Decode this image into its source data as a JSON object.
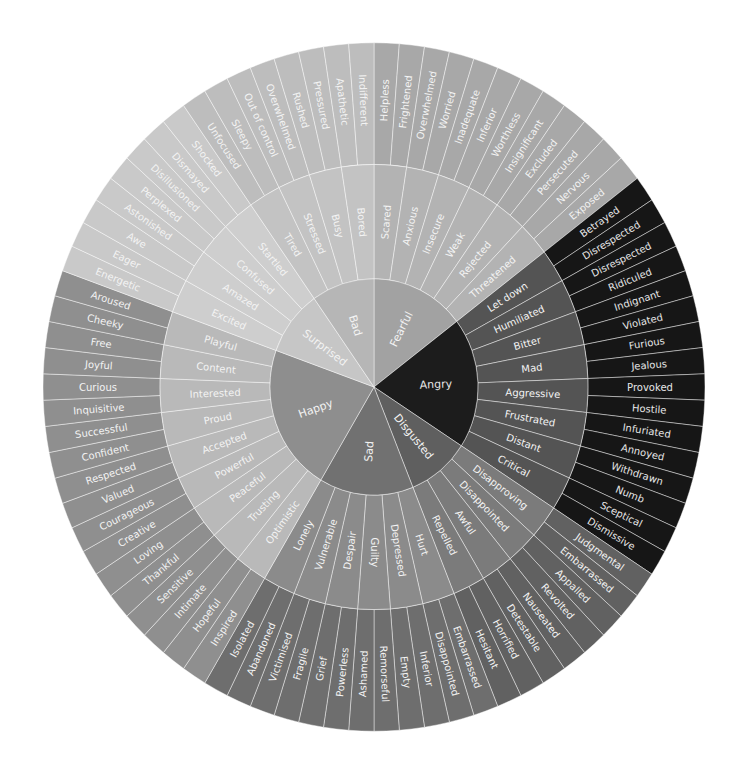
{
  "wheel": {
    "title": "",
    "geometry": {
      "center": [
        374,
        387
      ],
      "radii": [
        0,
        104,
        214,
        331
      ],
      "y_scale": 1.04
    },
    "label_color": "#f3f3f3",
    "divider_color": "#ffffff",
    "categories": [
      {
        "label": "Fearful",
        "colors": {
          "inner": "#a2a2a2",
          "middle": "#b3b3b3",
          "outer": "#a8a8a8"
        },
        "children": [
          {
            "label": "Scared",
            "children": [
              "Helpless",
              "Frightened"
            ]
          },
          {
            "label": "Anxious",
            "children": [
              "Overwhelmed",
              "Worried"
            ]
          },
          {
            "label": "Insecure",
            "children": [
              "Inadequate",
              "Inferior"
            ]
          },
          {
            "label": "Weak",
            "children": [
              "Worthless",
              "Insignificant"
            ]
          },
          {
            "label": "Rejected",
            "children": [
              "Excluded",
              "Persecuted"
            ]
          },
          {
            "label": "Threatened",
            "children": [
              "Nervous",
              "Exposed"
            ]
          }
        ]
      },
      {
        "label": "Angry",
        "colors": {
          "inner": "#1c1c1c",
          "middle": "#545454",
          "outer": "#161616"
        },
        "children": [
          {
            "label": "Let down",
            "children": [
              "Betrayed",
              "Disrespected"
            ]
          },
          {
            "label": "Humiliated",
            "children": [
              "Disrespected",
              "Ridiculed"
            ]
          },
          {
            "label": "Bitter",
            "children": [
              "Indignant",
              "Violated"
            ]
          },
          {
            "label": "Mad",
            "children": [
              "Furious",
              "Jealous"
            ]
          },
          {
            "label": "Aggressive",
            "children": [
              "Provoked",
              "Hostile"
            ]
          },
          {
            "label": "Frustrated",
            "children": [
              "Infuriated",
              "Annoyed"
            ]
          },
          {
            "label": "Distant",
            "children": [
              "Withdrawn",
              "Numb"
            ]
          },
          {
            "label": "Critical",
            "children": [
              "Sceptical",
              "Dismissive"
            ]
          }
        ]
      },
      {
        "label": "Disgusted",
        "colors": {
          "inner": "#5f5f5f",
          "middle": "#7b7b7b",
          "outer": "#616161"
        },
        "children": [
          {
            "label": "Disapproving",
            "children": [
              "Judgmental",
              "Embarrassed"
            ]
          },
          {
            "label": "Disappointed",
            "children": [
              "Appalled",
              "Revolted"
            ]
          },
          {
            "label": "Awful",
            "children": [
              "Nauseated",
              "Detestable"
            ]
          },
          {
            "label": "Repelled",
            "children": [
              "Horrified",
              "Hesitant"
            ]
          }
        ]
      },
      {
        "label": "Sad",
        "colors": {
          "inner": "#717171",
          "middle": "#8b8b8b",
          "outer": "#6e6e6e"
        },
        "children": [
          {
            "label": "Hurt",
            "children": [
              "Embarrassed",
              "Disappointed"
            ]
          },
          {
            "label": "Depressed",
            "children": [
              "Inferior",
              "Empty"
            ]
          },
          {
            "label": "Guilty",
            "children": [
              "Remorseful",
              "Ashamed"
            ]
          },
          {
            "label": "Despair",
            "children": [
              "Powerless",
              "Grief"
            ]
          },
          {
            "label": "Vulnerable",
            "children": [
              "Fragile",
              "Victimised"
            ]
          },
          {
            "label": "Lonely",
            "children": [
              "Abandoned",
              "Isolated"
            ]
          }
        ]
      },
      {
        "label": "Happy",
        "colors": {
          "inner": "#8e8e8e",
          "middle": "#b9b9b9",
          "outer": "#8f8f8f"
        },
        "children": [
          {
            "label": "Optimistic",
            "children": [
              "Inspired",
              "Hopeful"
            ]
          },
          {
            "label": "Trusting",
            "children": [
              "Intimate",
              "Sensitive"
            ]
          },
          {
            "label": "Peaceful",
            "children": [
              "Thankful",
              "Loving"
            ]
          },
          {
            "label": "Powerful",
            "children": [
              "Creative",
              "Courageous"
            ]
          },
          {
            "label": "Accepted",
            "children": [
              "Valued",
              "Respected"
            ]
          },
          {
            "label": "Proud",
            "children": [
              "Confident",
              "Successful"
            ]
          },
          {
            "label": "Interested",
            "children": [
              "Inquisitive",
              "Curious"
            ]
          },
          {
            "label": "Content",
            "children": [
              "Joyful",
              "Free"
            ]
          },
          {
            "label": "Playful",
            "children": [
              "Cheeky",
              "Aroused"
            ]
          }
        ]
      },
      {
        "label": "Surprised",
        "colors": {
          "inner": "#c6c6c6",
          "middle": "#cecece",
          "outer": "#c9c9c9"
        },
        "children": [
          {
            "label": "Excited",
            "children": [
              "Energetic",
              "Eager"
            ]
          },
          {
            "label": "Amazed",
            "children": [
              "Awe",
              "Astonished"
            ]
          },
          {
            "label": "Confused",
            "children": [
              "Perplexed",
              "Disillusioned"
            ]
          },
          {
            "label": "Startled",
            "children": [
              "Dismayed",
              "Shocked"
            ]
          }
        ]
      },
      {
        "label": "Bad",
        "colors": {
          "inner": "#b6b6b6",
          "middle": "#c3c3c3",
          "outer": "#bdbdbd"
        },
        "children": [
          {
            "label": "Tired",
            "children": [
              "Unfocused",
              "Sleepy"
            ]
          },
          {
            "label": "Stressed",
            "children": [
              "Out of control",
              "Overwhelmed"
            ]
          },
          {
            "label": "Busy",
            "children": [
              "Rushed",
              "Pressured"
            ]
          },
          {
            "label": "Bored",
            "children": [
              "Apathetic",
              "Indifferent"
            ]
          }
        ]
      }
    ]
  }
}
